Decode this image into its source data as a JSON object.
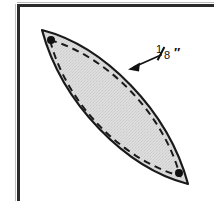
{
  "figure": {
    "width": 214,
    "height": 208,
    "background_color": "#ffffff"
  },
  "frame": {
    "top_rule_color": "#2b2b2b",
    "left_rule_color": "#2b2b2b",
    "hairline_color": "#bfbfbf"
  },
  "shape": {
    "name": "lens-leaf-patch",
    "fill_color": "#d9d9d9",
    "outline_color": "#1a1a1a",
    "outline_width": 2.2,
    "seam_line_style": "dashed",
    "seam_line_color": "#1a1a1a",
    "seam_line_width": 2.0,
    "seam_dash_pattern": "7 5",
    "top_vertex": [
      42,
      30
    ],
    "bottom_vertex": [
      188,
      184
    ],
    "left_bulge": [
      47,
      150
    ],
    "right_bulge": [
      183,
      64
    ]
  },
  "markers": {
    "dot_color": "#111111",
    "dot_radius": 4,
    "top_dot": [
      51,
      40
    ],
    "bottom_dot": [
      179,
      173
    ]
  },
  "callout": {
    "arrow_color": "#111111",
    "arrow_tail": [
      161,
      55
    ],
    "arrow_head": [
      131,
      68
    ],
    "label_numerator": "1",
    "label_denominator": "8",
    "label_unit": "″",
    "label_text": "1/8\"",
    "meaning": "seam allowance"
  }
}
